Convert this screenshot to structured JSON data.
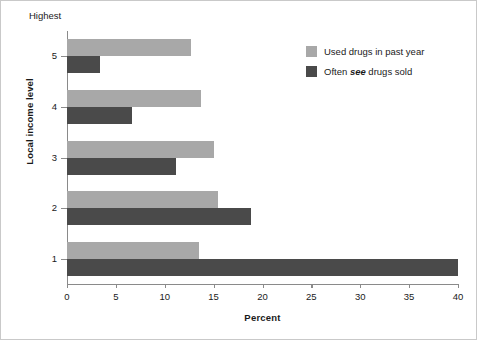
{
  "chart_data": {
    "type": "bar",
    "orientation": "horizontal",
    "title": "",
    "xlabel": "Percent",
    "ylabel": "Local income level",
    "top_annotation": "Highest",
    "categories": [
      "1",
      "2",
      "3",
      "4",
      "5"
    ],
    "xlim": [
      0,
      40
    ],
    "xticks": [
      0,
      5,
      10,
      15,
      20,
      25,
      30,
      35,
      40
    ],
    "grid": false,
    "legend_position": "upper right",
    "series": [
      {
        "name": "Used drugs in past year",
        "color": "#a8a8a8",
        "values": [
          13.5,
          15.4,
          15.0,
          13.7,
          12.7
        ]
      },
      {
        "name": "Often see drugs sold",
        "name_parts": [
          "Often ",
          "see",
          " drugs sold"
        ],
        "color": "#4a4a4a",
        "values": [
          40.0,
          18.8,
          11.2,
          6.7,
          3.4
        ]
      }
    ]
  },
  "colors": {
    "light_bar": "#a8a8a8",
    "dark_bar": "#4a4a4a",
    "axis": "#8a8a8a",
    "frame": "#c9c9c9",
    "text": "#1a1a1a"
  }
}
